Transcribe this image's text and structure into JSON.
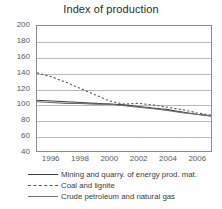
{
  "chart_data": {
    "type": "line",
    "title": "Index of production",
    "xlabel": "",
    "ylabel": "",
    "xlim": [
      1995,
      2007
    ],
    "ylim": [
      40,
      200
    ],
    "ytick_labels": [
      "200",
      "180",
      "160",
      "140",
      "120",
      "100",
      "80",
      "60",
      "40"
    ],
    "yticks": [
      200,
      180,
      160,
      140,
      120,
      100,
      80,
      60,
      40
    ],
    "xtick_labels": [
      "1996",
      "1998",
      "2000",
      "2002",
      "2004",
      "2006"
    ],
    "xticks": [
      1996,
      1998,
      2000,
      2002,
      2004,
      2006
    ],
    "grid": true,
    "legend_position": "below",
    "x": [
      1995,
      1996,
      1997,
      1998,
      1999,
      2000,
      2001,
      2002,
      2003,
      2004,
      2005,
      2006,
      2007
    ],
    "series": [
      {
        "name": "Mining and quarry. of energy prod. mat.",
        "style": "solid",
        "color": "#3f3f3f",
        "values": [
          105,
          104,
          103,
          102,
          101,
          100,
          99,
          97,
          95,
          93,
          90,
          87,
          85
        ]
      },
      {
        "name": "Coal and lignite",
        "style": "dashed",
        "color": "#555555",
        "values": [
          140,
          135,
          128,
          120,
          112,
          104,
          100,
          101,
          99,
          96,
          93,
          89,
          86
        ]
      },
      {
        "name": "Crude petroleum and natural gas",
        "style": "solid",
        "color": "#6e6e6e",
        "values": [
          103,
          102,
          101,
          101,
          100,
          100,
          98,
          96,
          94,
          92,
          89,
          87,
          85
        ]
      }
    ]
  }
}
